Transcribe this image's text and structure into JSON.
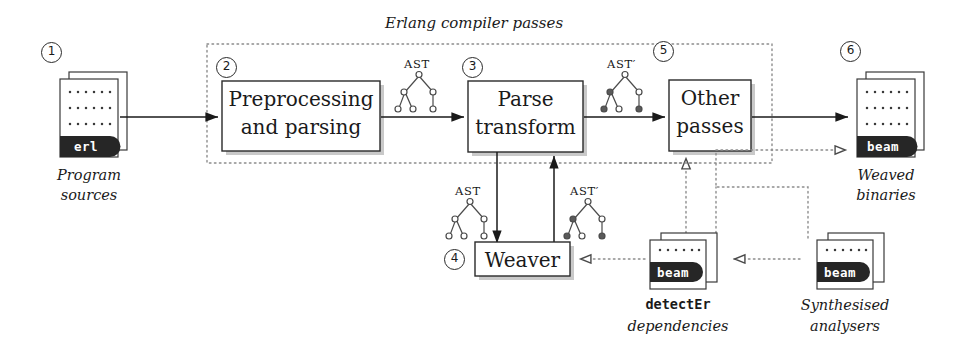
{
  "figure": {
    "group_title": "Erlang compiler passes"
  },
  "steps": {
    "one": "1",
    "two": "2",
    "three": "3",
    "four": "4",
    "five": "5",
    "six": "6"
  },
  "nodes": {
    "program_sources": {
      "tag": "erl",
      "caption_line1": "Program",
      "caption_line2": "sources"
    },
    "preprocessing": {
      "line1": "Preprocessing",
      "line2": "and parsing"
    },
    "parse_transform": {
      "line1": "Parse",
      "line2": "transform"
    },
    "other_passes": {
      "line1": "Other",
      "line2": "passes"
    },
    "weaver": {
      "label": "Weaver"
    },
    "weaved_binaries": {
      "tag": "beam",
      "caption_line1": "Weaved",
      "caption_line2": "binaries"
    },
    "detecter_deps": {
      "tag": "beam",
      "caption_line1": "detectEr",
      "caption_line2": "dependencies"
    },
    "synthesised_analysers": {
      "tag": "beam",
      "caption_line1": "Synthesised",
      "caption_line2": "analysers"
    }
  },
  "edge_labels": {
    "ast_top": "AST",
    "ast_prime_top": "AST′",
    "ast_bottom": "AST",
    "ast_prime_bottom": "AST′"
  },
  "colors": {
    "ink": "#1a1a1a",
    "stroke": "#333333",
    "tag_fill": "#262626",
    "paper": "#ffffff",
    "dotted": "#8c8c8c",
    "shadow": "#bfbfbf",
    "node_fill_dark": "#5a5a5a"
  }
}
